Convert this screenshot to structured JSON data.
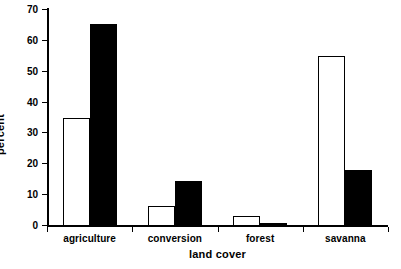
{
  "chart_data": {
    "type": "bar",
    "title": "",
    "subtitle": "",
    "xlabel": "land cover",
    "ylabel": "percent",
    "categories": [
      "agriculture",
      "conversion",
      "forest",
      "savanna"
    ],
    "series": [
      {
        "name": "open",
        "style": "white-filled-black-outline",
        "values": [
          35,
          6.5,
          3.2,
          55
        ]
      },
      {
        "name": "solid",
        "style": "black-filled",
        "values": [
          65.5,
          14.5,
          1,
          18
        ]
      }
    ],
    "ylim": [
      0,
      70
    ],
    "yticks": [
      0,
      10,
      20,
      30,
      40,
      50,
      60,
      70
    ],
    "ytick_labels": [
      "0",
      "10",
      "20",
      "30",
      "40",
      "50",
      "60",
      "70"
    ],
    "grid": false,
    "legend": false,
    "legend_position": "none",
    "axis_color": "#000000",
    "background_color": "#ffffff"
  }
}
